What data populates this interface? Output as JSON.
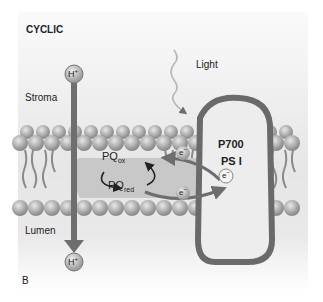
{
  "diagram": {
    "title": "CYCLIC",
    "panel_label": "B",
    "regions": {
      "top": "Stroma",
      "bottom": "Lumen"
    },
    "light_label": "Light",
    "proton_top": "H",
    "proton_bottom": "H",
    "proton_superscript": "+",
    "photosystem": {
      "line1": "P700",
      "line2": "PS I"
    },
    "pq_ox": {
      "base": "PQ",
      "sub": "ox"
    },
    "pq_red": {
      "base": "PQ",
      "sub": "red"
    },
    "electron": "e",
    "electron_superscript": "−",
    "colors": {
      "arrow": "#6e6e6e",
      "complex_border": "#6a6a6a",
      "complex_fill": "#ededed",
      "pq_fill": "#c8c8c8",
      "lipid_head": "#a8a8a8",
      "light_wave": "#b5b5b5"
    }
  }
}
